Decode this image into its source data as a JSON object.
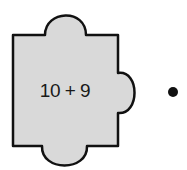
{
  "puzzle_piece": {
    "expression": "10 + 9",
    "fill": "#d9d9d9",
    "stroke": "#111111"
  },
  "dot": {
    "color": "#111111"
  }
}
